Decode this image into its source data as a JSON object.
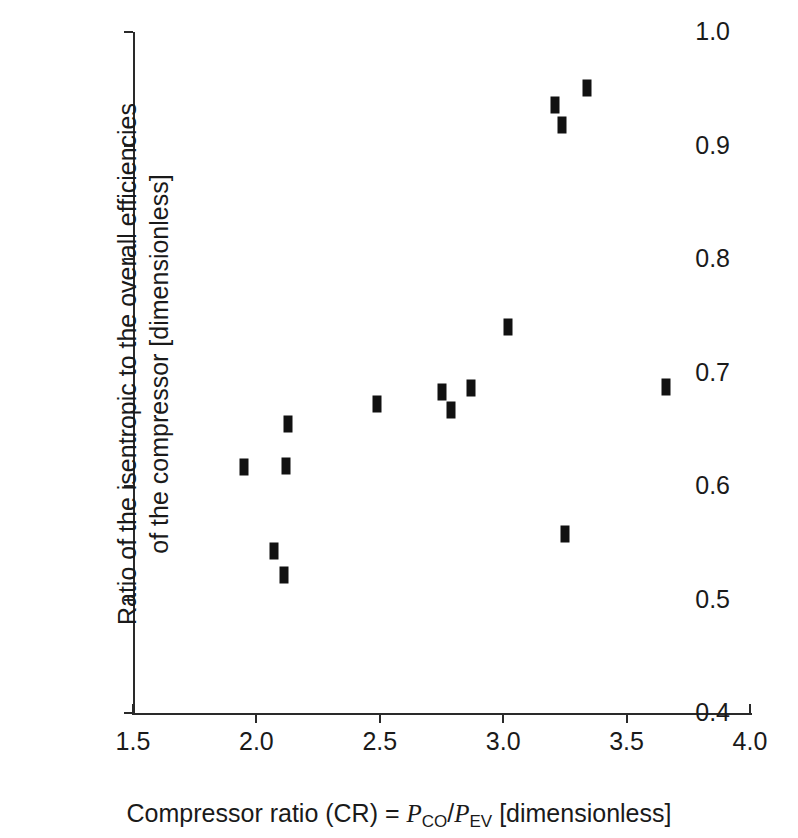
{
  "chart_data": {
    "type": "scatter",
    "title": "",
    "xlabel": "Compressor ratio (CR) = P_CO/P_EV [dimensionless]",
    "ylabel": "Ratio of the isentropic to the overall efficiencies of the compressor [dimensionless]",
    "xlim": [
      1.5,
      4.0
    ],
    "ylim": [
      0.4,
      1.0
    ],
    "grid": false,
    "legend": "none",
    "marker_color": "#111111",
    "marker_style": "filled vertical bar",
    "x": [
      1.95,
      2.07,
      2.11,
      2.12,
      2.13,
      2.49,
      2.75,
      2.79,
      2.87,
      3.02,
      3.21,
      3.24,
      3.25,
      3.34,
      3.66
    ],
    "y": [
      0.617,
      0.543,
      0.522,
      0.618,
      0.655,
      0.672,
      0.683,
      0.667,
      0.686,
      0.74,
      0.936,
      0.918,
      0.558,
      0.951,
      0.687
    ],
    "points": [
      {
        "x": 1.95,
        "y": 0.617
      },
      {
        "x": 2.07,
        "y": 0.543
      },
      {
        "x": 2.11,
        "y": 0.522
      },
      {
        "x": 2.12,
        "y": 0.618
      },
      {
        "x": 2.13,
        "y": 0.655
      },
      {
        "x": 2.49,
        "y": 0.672
      },
      {
        "x": 2.75,
        "y": 0.683
      },
      {
        "x": 2.79,
        "y": 0.667
      },
      {
        "x": 2.87,
        "y": 0.686
      },
      {
        "x": 3.02,
        "y": 0.74
      },
      {
        "x": 3.21,
        "y": 0.936
      },
      {
        "x": 3.24,
        "y": 0.918
      },
      {
        "x": 3.25,
        "y": 0.558
      },
      {
        "x": 3.34,
        "y": 0.951
      },
      {
        "x": 3.66,
        "y": 0.687
      }
    ]
  },
  "axes": {
    "y_ticks": [
      {
        "value": 1.0,
        "label": "1.0"
      },
      {
        "value": 0.9,
        "label": "0.9"
      },
      {
        "value": 0.8,
        "label": "0.8"
      },
      {
        "value": 0.7,
        "label": "0.7"
      },
      {
        "value": 0.6,
        "label": "0.6"
      },
      {
        "value": 0.5,
        "label": "0.5"
      },
      {
        "value": 0.4,
        "label": "0.4"
      }
    ],
    "x_ticks": [
      {
        "value": 1.5,
        "label": "1.5"
      },
      {
        "value": 2.0,
        "label": "2.0"
      },
      {
        "value": 2.5,
        "label": "2.5"
      },
      {
        "value": 3.0,
        "label": "3.0"
      },
      {
        "value": 3.5,
        "label": "3.5"
      },
      {
        "value": 4.0,
        "label": "4.0"
      }
    ],
    "y_title_line1": "Ratio of the isentropic to the overall efficiencies",
    "y_title_line2": "of the compressor [dimensionless]",
    "x_title_prefix": "Compressor ratio (CR) = ",
    "x_title_p1": "P",
    "x_title_p1_sub": "CO",
    "x_title_slash": "/",
    "x_title_p2": "P",
    "x_title_p2_sub": "EV",
    "x_title_suffix": " [dimensionless]"
  }
}
